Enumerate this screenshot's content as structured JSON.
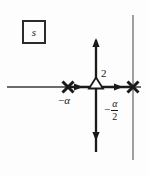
{
  "figure": {
    "type": "pole-zero-plot",
    "plane_label": "s",
    "axes": {
      "real_axis": {
        "orientation": "horizontal",
        "y": 87,
        "x_start": 7,
        "x_end": 141,
        "arrow_direction": "right",
        "arrow_positions": [
          78,
          118
        ]
      },
      "imaginary_axis": {
        "orientation": "vertical",
        "x": 96,
        "y_top": 40,
        "y_bottom": 152,
        "arrow_directions": [
          "up",
          "down"
        ]
      },
      "secondary_vertical_line": {
        "x": 133,
        "y_top": 15,
        "y_bottom": 160,
        "style": "thin"
      }
    },
    "markers": [
      {
        "kind": "pole",
        "glyph": "X",
        "label": "−α",
        "label_position": "below",
        "x": 68,
        "y": 87
      },
      {
        "kind": "zero",
        "glyph": "open-triangle-up",
        "label": "2",
        "label_position": "upper-right",
        "multiplicity": 2,
        "x": 96,
        "y": 87
      },
      {
        "kind": "pole",
        "glyph": "X",
        "label": "",
        "x": 133,
        "y": 87
      }
    ],
    "labels": {
      "plane": "s",
      "neg_alpha": "−α",
      "neg_alpha_minus": "−",
      "neg_alpha_symbol": "α",
      "multiplicity": "2",
      "fraction_dash": "−",
      "fraction_numerator": "α",
      "fraction_denominator": "2"
    },
    "colors": {
      "ink": "#1a1a1a",
      "line": "#2b2b2b",
      "background": "#fdfdfd"
    }
  }
}
